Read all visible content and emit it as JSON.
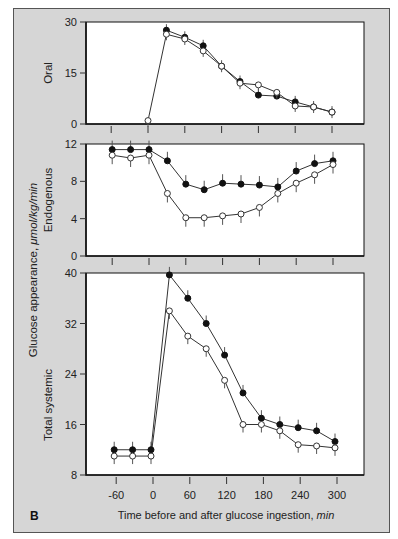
{
  "figure": {
    "panel_letter": "B",
    "y_axis_label": "Glucose appearance, ",
    "y_axis_unit": "μmol/kg/min",
    "x_axis_label": "Time before and after glucose ingestion, ",
    "x_axis_unit": "min",
    "colors": {
      "background": "#d6d6d6",
      "plot": "#ffffff",
      "ink": "#111111"
    }
  },
  "chart_data": [
    {
      "type": "line",
      "title": "Oral",
      "ylabel": "Oral",
      "xlabel": "Time before and after glucose ingestion, min",
      "ylim": [
        0,
        30
      ],
      "yticks": [
        0,
        15,
        30
      ],
      "xticks": [
        -60,
        0,
        60,
        120,
        180,
        240,
        300
      ],
      "x": [
        0,
        30,
        60,
        90,
        120,
        150,
        180,
        210,
        240,
        270,
        300
      ],
      "series": [
        {
          "name": "filled",
          "marker": "filled-circle",
          "values": [
            null,
            27.6,
            25.5,
            23,
            17,
            12.5,
            8.5,
            8.2,
            6.5,
            5,
            3.5
          ]
        },
        {
          "name": "open",
          "marker": "open-circle",
          "values": [
            1,
            26.4,
            25,
            21.5,
            17,
            12,
            11.5,
            9.3,
            5.3,
            5,
            3.5
          ]
        }
      ],
      "grid": false
    },
    {
      "type": "line",
      "title": "Endogenous",
      "ylabel": "Endogenous",
      "ylim": [
        0,
        12
      ],
      "yticks": [
        0,
        4,
        8,
        12
      ],
      "xticks": [
        -60,
        0,
        60,
        120,
        180,
        240,
        300
      ],
      "x": [
        -60,
        -30,
        0,
        30,
        60,
        90,
        120,
        150,
        180,
        210,
        240,
        270,
        300
      ],
      "series": [
        {
          "name": "filled",
          "marker": "filled-circle",
          "values": [
            11.4,
            11.4,
            11.4,
            10.2,
            7.7,
            7.1,
            7.8,
            7.7,
            7.6,
            7.4,
            9.1,
            9.9,
            10.2
          ]
        },
        {
          "name": "open",
          "marker": "open-circle",
          "values": [
            10.8,
            10.5,
            10.8,
            6.7,
            4.1,
            4.1,
            4.3,
            4.5,
            5.2,
            6.7,
            7.8,
            8.7,
            9.8
          ]
        }
      ],
      "grid": false
    },
    {
      "type": "line",
      "title": "Total systemic",
      "ylabel": "Total systemic",
      "xlabel": "Time before and after glucose ingestion, min",
      "ylim": [
        8,
        40
      ],
      "yticks": [
        8,
        16,
        24,
        32,
        40
      ],
      "xticks": [
        -60,
        0,
        60,
        120,
        180,
        240,
        300
      ],
      "x": [
        -60,
        -30,
        0,
        30,
        60,
        90,
        120,
        150,
        180,
        210,
        240,
        270,
        300
      ],
      "series": [
        {
          "name": "filled",
          "marker": "filled-circle",
          "values": [
            12,
            12,
            12,
            39.7,
            36,
            32,
            27,
            21,
            17,
            16,
            15.5,
            15,
            13.3
          ]
        },
        {
          "name": "open",
          "marker": "open-circle",
          "values": [
            11,
            11,
            11,
            34,
            30,
            28,
            23,
            16,
            16,
            15,
            12.8,
            12.6,
            12.3
          ]
        }
      ],
      "grid": false
    }
  ]
}
